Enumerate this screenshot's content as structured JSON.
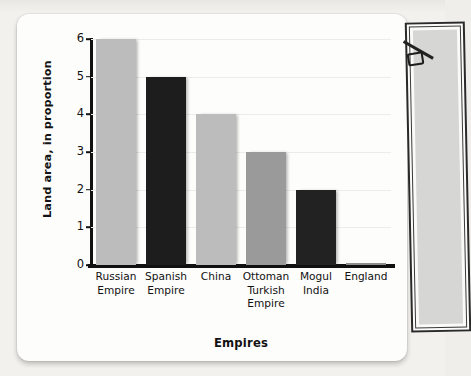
{
  "chart_data": {
    "type": "bar",
    "title": "",
    "xlabel": "Empires",
    "ylabel": "Land area, in proportion",
    "categories": [
      "Russian Empire",
      "Spanish Empire",
      "China",
      "Ottoman Turkish Empire",
      "Mogul India",
      "England"
    ],
    "values": [
      6,
      5,
      4,
      3,
      2,
      0
    ],
    "ylim": [
      0,
      6
    ],
    "yticks": [
      "0",
      "1",
      "2",
      "3",
      "4",
      "5",
      "6"
    ],
    "grid": true,
    "legend": "none",
    "bar_colors": [
      "#bcbcbc",
      "#1d1d1d",
      "#bcbcbc",
      "#9a9a9a",
      "#222222",
      "#8e8e8e"
    ]
  },
  "axis": {
    "y_title": "Land area, in proportion",
    "x_title": "Empires",
    "tick_0": "0",
    "tick_1": "1",
    "tick_2": "2",
    "tick_3": "3",
    "tick_4": "4",
    "tick_5": "5",
    "tick_6": "6"
  },
  "xlabels": [
    {
      "line1": "Russian",
      "line2": "Empire",
      "line3": ""
    },
    {
      "line1": "Spanish",
      "line2": "Empire",
      "line3": ""
    },
    {
      "line1": "China",
      "line2": "",
      "line3": ""
    },
    {
      "line1": "Ottoman",
      "line2": "Turkish",
      "line3": "Empire"
    },
    {
      "line1": "Mogul",
      "line2": "India",
      "line3": ""
    },
    {
      "line1": "England",
      "line2": "",
      "line3": ""
    }
  ],
  "colors": {
    "page_background": "#f2f1ed",
    "card_background": "#fdfdfc",
    "axis": "#111111",
    "gridline": "#ececeb",
    "bar_light": "#bcbcbc",
    "bar_mid": "#9a9a9a",
    "bar_dark": "#1d1d1d"
  }
}
